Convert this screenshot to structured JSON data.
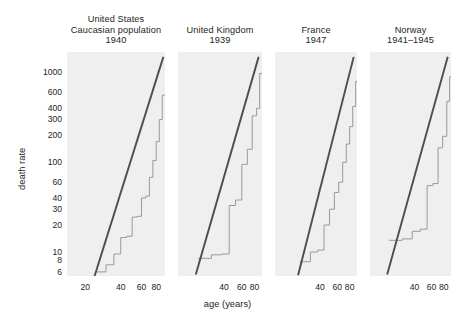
{
  "figure": {
    "background": "#ffffff",
    "panel_background": "#efefef",
    "step_color": "#9a9a9a",
    "fit_color": "#4d4d4d",
    "text_color": "#231f20"
  },
  "axes": {
    "ylabel": "death rate",
    "xlabel": "age (years)",
    "y_scale": "log",
    "x_scale": "log",
    "ylim": [
      5.4,
      1700
    ],
    "xlim": [
      14,
      95
    ],
    "y_ticks": [
      1000,
      600,
      400,
      300,
      200,
      100,
      60,
      40,
      30,
      20,
      10,
      8,
      6
    ],
    "y_tick_labels": [
      "1000",
      "600",
      "400",
      "300",
      "200",
      "100",
      "60",
      "40",
      "30",
      "20",
      "10",
      "8",
      "6"
    ],
    "x_ticks_panel1": [
      20,
      40,
      60,
      80
    ],
    "x_tick_labels_panel1": [
      "20",
      "40",
      "60",
      "80"
    ],
    "x_ticks_other": [
      40,
      60,
      80
    ],
    "x_tick_labels_other": [
      "40",
      "60",
      "80"
    ],
    "grid": false,
    "legend": "none"
  },
  "chart_data": {
    "type": "line",
    "title": "",
    "subtitle": "",
    "xlabel": "age (years)",
    "ylabel": "death rate",
    "xscale": "log",
    "yscale": "log",
    "xlim": [
      14,
      95
    ],
    "ylim": [
      5.4,
      1700
    ],
    "grid": false,
    "legend": "none",
    "panels": [
      {
        "name": "united-states",
        "title": "United States\nCaucasian population\n1940",
        "country": "United States",
        "note": "Caucasian population",
        "year": "1940",
        "x_ticks": [
          20,
          40,
          60,
          80
        ],
        "series": [
          {
            "name": "observed age-specific death rate (step)",
            "style": "step",
            "x": [
              25,
              30,
              35,
              40,
              45,
              50,
              55,
              60,
              65,
              70,
              75,
              80,
              85,
              90
            ],
            "values": [
              6.0,
              7.2,
              9.5,
              14.5,
              15.0,
              24.5,
              25.0,
              40.0,
              42.0,
              68.0,
              105.0,
              170.0,
              300.0,
              560.0
            ]
          },
          {
            "name": "Gompertz fit (straight line)",
            "style": "line",
            "x": [
              24,
              92
            ],
            "values": [
              5.4,
              1500
            ]
          }
        ]
      },
      {
        "name": "united-kingdom",
        "title": "United Kingdom\n1939",
        "country": "United Kingdom",
        "note": "",
        "year": "1939",
        "x_ticks": [
          40,
          60,
          80
        ],
        "series": [
          {
            "name": "observed age-specific death rate (step)",
            "style": "step",
            "x": [
              22,
              30,
              38,
              45,
              52,
              60,
              68,
              76,
              84,
              90
            ],
            "values": [
              8.5,
              9.3,
              9.5,
              33.0,
              38.0,
              95.0,
              140.0,
              330.0,
              400.0,
              980.0
            ]
          },
          {
            "name": "Gompertz fit (straight line)",
            "style": "line",
            "x": [
              21,
              88
            ],
            "values": [
              5.6,
              1500
            ]
          }
        ]
      },
      {
        "name": "france",
        "title": "France\n1947",
        "country": "France",
        "note": "",
        "year": "1947",
        "x_ticks": [
          40,
          60,
          80
        ],
        "series": [
          {
            "name": "observed age-specific death rate (step)",
            "style": "step",
            "x": [
              25,
              32,
              38,
              44,
              50,
              56,
              62,
              68,
              74,
              80,
              86,
              92
            ],
            "values": [
              7.8,
              10.0,
              10.5,
              20.0,
              30.0,
              46.0,
              60.0,
              100.0,
              160.0,
              250.0,
              420.0,
              800.0
            ]
          },
          {
            "name": "Gompertz fit (straight line)",
            "style": "line",
            "x": [
              24,
              88
            ],
            "values": [
              5.5,
              1500
            ]
          }
        ]
      },
      {
        "name": "norway",
        "title": "Norway\n1941–1945",
        "country": "Norway",
        "note": "",
        "year": "1941–1945",
        "x_ticks": [
          40,
          60,
          80
        ],
        "series": [
          {
            "name": "observed age-specific death rate (step)",
            "style": "step",
            "x": [
              22,
              30,
              38,
              46,
              54,
              62,
              70,
              78,
              86,
              92
            ],
            "values": [
              13.5,
              14.0,
              17.0,
              18.0,
              55.0,
              58.0,
              145.0,
              195.0,
              480.0,
              900.0
            ]
          },
          {
            "name": "Gompertz fit (straight line)",
            "style": "line",
            "x": [
              21,
              88
            ],
            "values": [
              5.6,
              1500
            ]
          }
        ]
      }
    ]
  }
}
